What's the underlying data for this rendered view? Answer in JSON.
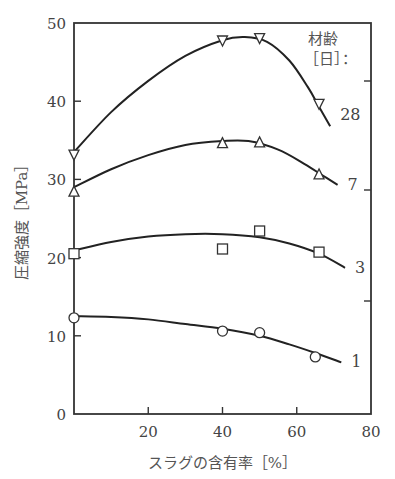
{
  "chart_data": {
    "type": "line",
    "title": "",
    "xlabel": "スラグの含有率［%］",
    "ylabel": "圧縮強度［MPa］",
    "xlim": [
      0,
      80
    ],
    "ylim": [
      0,
      50
    ],
    "x_ticks": [
      20,
      40,
      60,
      80
    ],
    "y_ticks": [
      0,
      10,
      20,
      30,
      40,
      50
    ],
    "grid": false,
    "legend": {
      "title_line1": "材齢",
      "title_line2": "［日］：",
      "position": "top-right"
    },
    "series": [
      {
        "name": "28",
        "marker": "triangle-down",
        "points": [
          [
            0,
            33.1
          ],
          [
            40,
            47.7
          ],
          [
            50,
            48.0
          ],
          [
            66,
            39.6
          ]
        ],
        "curve": [
          [
            0,
            33.5
          ],
          [
            10,
            38.6
          ],
          [
            20,
            42.6
          ],
          [
            30,
            45.8
          ],
          [
            40,
            47.8
          ],
          [
            46,
            48.2
          ],
          [
            52,
            47.6
          ],
          [
            58,
            45.2
          ],
          [
            63,
            41.8
          ],
          [
            66,
            39.3
          ],
          [
            69,
            36.8
          ]
        ]
      },
      {
        "name": "7",
        "marker": "triangle-up",
        "points": [
          [
            0,
            28.5
          ],
          [
            40,
            34.7
          ],
          [
            50,
            34.8
          ],
          [
            66,
            30.7
          ]
        ],
        "curve": [
          [
            0,
            29.0
          ],
          [
            10,
            31.3
          ],
          [
            20,
            33.1
          ],
          [
            30,
            34.4
          ],
          [
            40,
            34.9
          ],
          [
            47,
            34.9
          ],
          [
            55,
            33.8
          ],
          [
            62,
            32.0
          ],
          [
            67,
            30.5
          ],
          [
            71,
            29.3
          ]
        ]
      },
      {
        "name": "3",
        "marker": "square",
        "points": [
          [
            0,
            20.5
          ],
          [
            40,
            21.1
          ],
          [
            50,
            23.4
          ],
          [
            66,
            20.7
          ]
        ],
        "curve": [
          [
            0,
            20.9
          ],
          [
            10,
            22.0
          ],
          [
            20,
            22.7
          ],
          [
            30,
            23.0
          ],
          [
            40,
            23.0
          ],
          [
            50,
            22.6
          ],
          [
            58,
            21.8
          ],
          [
            66,
            20.5
          ],
          [
            73,
            18.7
          ]
        ]
      },
      {
        "name": "1",
        "marker": "circle",
        "points": [
          [
            0,
            12.3
          ],
          [
            40,
            10.6
          ],
          [
            50,
            10.4
          ],
          [
            65,
            7.3
          ]
        ],
        "curve": [
          [
            0,
            12.5
          ],
          [
            10,
            12.4
          ],
          [
            20,
            12.1
          ],
          [
            30,
            11.5
          ],
          [
            40,
            10.9
          ],
          [
            50,
            10.0
          ],
          [
            58,
            8.9
          ],
          [
            65,
            7.8
          ],
          [
            72,
            6.6
          ]
        ]
      }
    ],
    "axis_tick_labels": {
      "x": [
        "20",
        "40",
        "60",
        "80"
      ],
      "y": [
        "0",
        "10",
        "20",
        "30",
        "40",
        "50"
      ]
    }
  }
}
